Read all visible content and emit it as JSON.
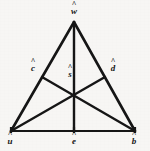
{
  "figure": {
    "kind": "geometry-diagram",
    "background_color": "#f7f6f4",
    "ink_color": "#161616",
    "canvas": {
      "width": 150,
      "height": 151
    }
  },
  "points": [
    {
      "id": "w",
      "name": "apex-vertex",
      "hat": "^",
      "glyph": "w",
      "label": "ŵ",
      "x": 74,
      "y": 22,
      "label_x": 74,
      "label_y": 3,
      "role": "triangle-vertex"
    },
    {
      "id": "c",
      "name": "left-side-midpoint",
      "hat": "^",
      "glyph": "c",
      "label": "ĉ",
      "x": 42,
      "y": 77,
      "label_x": 33,
      "label_y": 60,
      "role": "midpoint"
    },
    {
      "id": "s",
      "name": "centroid",
      "hat": "^",
      "glyph": "s",
      "label": "ŝ",
      "x": 74,
      "y": 92,
      "label_x": 70,
      "label_y": 66,
      "role": "median-intersection"
    },
    {
      "id": "d",
      "name": "right-side-midpoint",
      "hat": "^",
      "glyph": "d",
      "label": "d̂",
      "x": 105,
      "y": 77,
      "label_x": 113,
      "label_y": 60,
      "role": "midpoint"
    },
    {
      "id": "u",
      "name": "bottom-left-vertex",
      "hat": "^",
      "glyph": "u",
      "label": "û",
      "x": 11,
      "y": 131,
      "label_x": 10,
      "label_y": 133,
      "role": "triangle-vertex"
    },
    {
      "id": "e",
      "name": "base-midpoint",
      "hat": "^",
      "glyph": "e",
      "label": "ê",
      "x": 74,
      "y": 131,
      "label_x": 74,
      "label_y": 133,
      "role": "midpoint"
    },
    {
      "id": "b",
      "name": "bottom-right-vertex",
      "hat": "^",
      "glyph": "b",
      "label": "b̂",
      "x": 135,
      "y": 131,
      "label_x": 134,
      "label_y": 133,
      "role": "triangle-vertex"
    }
  ],
  "segments": [
    {
      "id": "side-wu",
      "name": "left-side",
      "from": "w",
      "to": "u",
      "width": 2.6
    },
    {
      "id": "side-wb",
      "name": "right-side",
      "from": "w",
      "to": "b",
      "width": 2.6
    },
    {
      "id": "side-ub",
      "name": "base-side",
      "from": "u",
      "to": "b",
      "width": 2.2
    },
    {
      "id": "median-we",
      "name": "median-from-apex",
      "from": "w",
      "to": "e",
      "width": 2.4
    },
    {
      "id": "median-ud",
      "name": "median-from-bottom-left",
      "from": "u",
      "to": "d",
      "width": 2.4
    },
    {
      "id": "median-bc",
      "name": "median-from-bottom-right",
      "from": "b",
      "to": "c",
      "width": 2.4
    }
  ],
  "tick_marks": [
    {
      "id": "tick-u",
      "name": "vertex-tick-u",
      "x": 11,
      "y": 131
    },
    {
      "id": "tick-e",
      "name": "vertex-tick-e",
      "x": 74,
      "y": 131
    },
    {
      "id": "tick-b",
      "name": "vertex-tick-b",
      "x": 135,
      "y": 131
    }
  ]
}
